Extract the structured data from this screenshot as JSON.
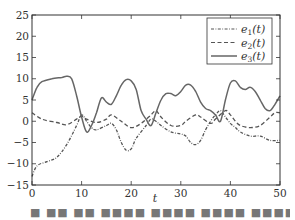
{
  "chart_data": {
    "type": "line",
    "title": "",
    "xlabel": "t",
    "ylabel": "",
    "xlim": [
      0,
      50
    ],
    "ylim": [
      -15,
      25
    ],
    "x_ticks": [
      0,
      10,
      20,
      30,
      40,
      50
    ],
    "y_ticks": [
      -15,
      -10,
      -5,
      0,
      5,
      10,
      15,
      20,
      25
    ],
    "x_tick_labels": [
      "0",
      "10",
      "20",
      "30",
      "40",
      "50"
    ],
    "y_tick_labels": [
      "−15",
      "−10",
      "−5",
      "0",
      "5",
      "10",
      "15",
      "20",
      "25"
    ],
    "grid": false,
    "legend_position": "upper right",
    "series": [
      {
        "name": "e1(t)",
        "label_base": "e",
        "label_sub": "1",
        "label_arg": "(t)",
        "style": "dash-dot",
        "color": "#555555",
        "t": [
          0,
          1,
          3,
          5,
          7,
          9,
          10,
          11,
          12,
          13,
          15,
          16,
          17,
          18,
          19,
          20,
          21,
          23,
          24,
          25,
          26,
          28,
          30,
          31,
          32,
          33,
          34,
          35,
          36,
          37,
          38,
          39,
          40,
          41,
          42,
          44,
          46,
          48,
          50
        ],
        "values": [
          -13,
          -10.5,
          -9.5,
          -8.5,
          -5.5,
          -1,
          1.5,
          0,
          -1.5,
          -2,
          -1,
          -0.5,
          -2,
          -5,
          -6.8,
          -6.5,
          -4,
          -1,
          0.5,
          0,
          -1,
          -2.5,
          -3,
          -3.5,
          -5,
          -5.5,
          -4.5,
          -2,
          0,
          1.5,
          2.5,
          1,
          -0.5,
          -1.5,
          -2.5,
          -3.5,
          -3.5,
          -4.5,
          -4.5
        ]
      },
      {
        "name": "e2(t)",
        "label_base": "e",
        "label_sub": "2",
        "label_arg": "(t)",
        "style": "dashed",
        "color": "#555555",
        "t": [
          0,
          2,
          5,
          7,
          9,
          10,
          11,
          13,
          15,
          16,
          18,
          20,
          22,
          24,
          25,
          26,
          28,
          30,
          31,
          33,
          34,
          36,
          37,
          39,
          40,
          41,
          42,
          44,
          46,
          48,
          49,
          50
        ],
        "values": [
          2,
          0.5,
          -0.3,
          -0.8,
          0.5,
          1.2,
          0.5,
          -0.3,
          0.5,
          1.5,
          0,
          -1.5,
          -0.5,
          1.5,
          2.5,
          1,
          -1,
          -1,
          0,
          1.5,
          1,
          -0.5,
          0.5,
          2.5,
          1.5,
          0,
          -1,
          -1.5,
          -1,
          1,
          2,
          2
        ]
      },
      {
        "name": "e3(t)",
        "label_base": "e",
        "label_sub": "3",
        "label_arg": "(t)",
        "style": "solid",
        "color": "#666666",
        "t": [
          0,
          1,
          2,
          4,
          6,
          7,
          8,
          9,
          10,
          11,
          12,
          13,
          14,
          15,
          16,
          17,
          18,
          19,
          20,
          21,
          22,
          23,
          24,
          25,
          26,
          27,
          28,
          29,
          30,
          31,
          32,
          33,
          34,
          35,
          36,
          37,
          38,
          39,
          40,
          41,
          42,
          43,
          44,
          45,
          46,
          47,
          48,
          49,
          50
        ],
        "values": [
          5,
          8,
          9.3,
          10,
          10.3,
          10.6,
          10,
          6,
          1,
          -2.5,
          -1,
          2,
          5.5,
          4.5,
          4,
          6,
          8.5,
          9.8,
          9.5,
          7.5,
          2.5,
          0.5,
          -1,
          2,
          5,
          6.5,
          6.5,
          6,
          7,
          8.5,
          8.5,
          7,
          4.5,
          3,
          2.5,
          1.5,
          0,
          5,
          9,
          9.5,
          8,
          7.5,
          8,
          7,
          5,
          3,
          2.5,
          4,
          6
        ]
      }
    ]
  },
  "caption_fragment": "■ ■■ ■■ ■■■■      ■■■■      ■■■■ ■■■■"
}
